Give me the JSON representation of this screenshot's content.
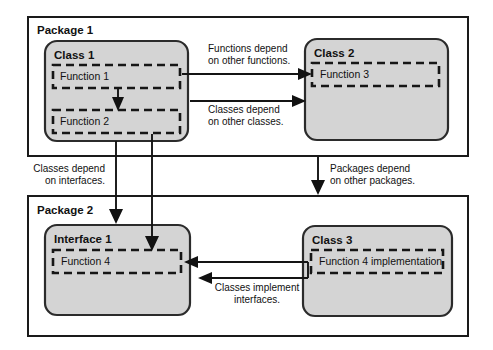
{
  "diagram": {
    "type": "uml-dependency-diagram",
    "colors": {
      "background": "#ffffff",
      "package_fill": "#ffffff",
      "package_border": "#1a1a1a",
      "class_fill": "#d4d4d4",
      "class_border": "#2b2b2b",
      "function_border": "#161616",
      "connector": "#141414",
      "text": "#111111"
    },
    "packages": [
      {
        "id": "package-1",
        "label": "Package 1",
        "classes": [
          {
            "id": "class-1",
            "label": "Class 1",
            "kind": "class",
            "functions": [
              {
                "id": "function-1",
                "label": "Function 1"
              },
              {
                "id": "function-2",
                "label": "Function 2"
              }
            ]
          },
          {
            "id": "class-2",
            "label": "Class 2",
            "kind": "class",
            "functions": [
              {
                "id": "function-3",
                "label": "Function 3"
              }
            ]
          }
        ]
      },
      {
        "id": "package-2",
        "label": "Package 2",
        "classes": [
          {
            "id": "interface-1",
            "label": "Interface 1",
            "kind": "interface",
            "functions": [
              {
                "id": "function-4",
                "label": "Function 4"
              }
            ]
          },
          {
            "id": "class-3",
            "label": "Class 3",
            "kind": "class",
            "functions": [
              {
                "id": "function-4-implementation",
                "label": "Function 4 implementation"
              }
            ]
          }
        ]
      }
    ],
    "edge_labels": [
      {
        "id": "functions-depend-on-functions",
        "line1": "Functions depend",
        "line2": "on other functions.",
        "align": "left",
        "from": "function-1",
        "to": "function-3"
      },
      {
        "id": "classes-depend-on-classes",
        "line1": "Classes depend",
        "line2": "on other classes.",
        "align": "left",
        "from": "class-1",
        "to": "class-2"
      },
      {
        "id": "classes-depend-on-interfaces",
        "line1": "Classes depend",
        "line2": "on interfaces.",
        "align": "right",
        "from": "class-1",
        "to": "interface-1"
      },
      {
        "id": "packages-depend-on-packages",
        "line1": "Packages depend",
        "line2": "on other packages.",
        "align": "left",
        "from": "package-1",
        "to": "package-2"
      },
      {
        "id": "classes-implement-interfaces",
        "line1": "Classes implement",
        "line2": "interfaces.",
        "align": "center",
        "from": "class-3",
        "to": "interface-1"
      }
    ]
  }
}
